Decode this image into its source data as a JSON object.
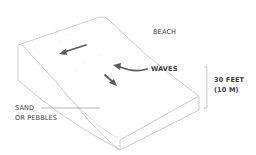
{
  "diagram": {
    "labels": {
      "beach": "BEACH",
      "waves": "WAVES",
      "height_line1": "30 FEET",
      "height_line2": "(10 M)",
      "material_line1": "SAND",
      "material_line2": "OR PEBBLES"
    },
    "colors": {
      "outline": "#c8c8c8",
      "arrow": "#5a5a5a",
      "text": "#444444"
    }
  }
}
